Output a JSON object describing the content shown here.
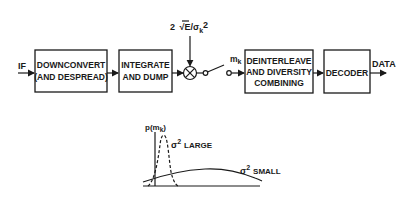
{
  "diagram": {
    "input_label": "IF",
    "output_label": "DATA",
    "blocks": [
      {
        "id": "downconvert",
        "lines": [
          "DOWNCONVERT",
          "(AND DESPREAD)"
        ]
      },
      {
        "id": "integrate",
        "lines": [
          "INTEGRATE",
          "AND DUMP"
        ]
      },
      {
        "id": "deinterleave",
        "lines": [
          "DEINTERLEAVE",
          "AND DIVERSITY",
          "COMBINING"
        ]
      },
      {
        "id": "decoder",
        "lines": [
          "DECODER"
        ]
      }
    ],
    "multiplier": {
      "weight_label_prefix": "2",
      "weight_label_sqrt": "√",
      "weight_label_E": "E/σ",
      "weight_label_sub": "k",
      "weight_label_sup": "2"
    },
    "switch": {
      "output_label_main": "m",
      "output_label_sub": "k"
    }
  },
  "plot": {
    "y_axis_label_prefix": "p(m",
    "y_axis_label_sub": "k",
    "y_axis_label_suffix": ")",
    "curves": [
      {
        "name": "large",
        "label_sigma": "σ",
        "label_sup": "2",
        "label_text": "LARGE",
        "style": "dashed"
      },
      {
        "name": "small",
        "label_sigma": "σ",
        "label_sup": "2",
        "label_text": "SMALL",
        "style": "solid"
      }
    ]
  }
}
